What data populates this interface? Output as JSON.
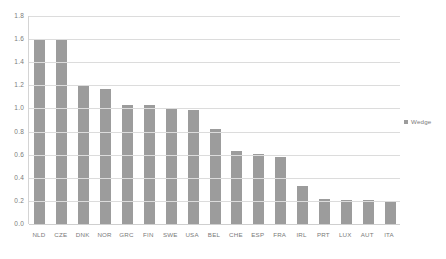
{
  "chart_data": {
    "type": "bar",
    "title": "",
    "xlabel": "",
    "ylabel": "",
    "ylim": [
      0.0,
      1.8
    ],
    "ytick_step": 0.2,
    "grid": true,
    "legend_position": "right",
    "bar_color": "#9c9c9c",
    "gridline_color": "#dcdcdc",
    "axis_text_color": "#7a7a7a",
    "categories": [
      "NLD",
      "CZE",
      "DNK",
      "NOR",
      "GRC",
      "FIN",
      "SWE",
      "USA",
      "BEL",
      "CHE",
      "ESP",
      "FRA",
      "IRL",
      "PRT",
      "LUX",
      "AUT",
      "ITA"
    ],
    "series": [
      {
        "name": "Wedge",
        "values": [
          1.6,
          1.6,
          1.2,
          1.17,
          1.03,
          1.03,
          1.0,
          0.99,
          0.82,
          0.63,
          0.61,
          0.58,
          0.33,
          0.22,
          0.21,
          0.21,
          0.19
        ]
      }
    ],
    "ytick_labels": [
      "0.0",
      "0.2",
      "0.4",
      "0.6",
      "0.8",
      "1.0",
      "1.2",
      "1.4",
      "1.6",
      "1.8"
    ],
    "ytick_values": [
      0.0,
      0.2,
      0.4,
      0.6,
      0.8,
      1.0,
      1.2,
      1.4,
      1.6,
      1.8
    ],
    "legend": [
      {
        "label": "Wedge",
        "color": "#9c9c9c"
      }
    ]
  }
}
